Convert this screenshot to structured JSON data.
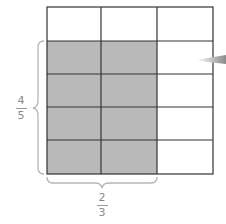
{
  "diagram": {
    "grid": {
      "rows": 5,
      "cols": 3,
      "shaded_rows": [
        1,
        2,
        3,
        4
      ],
      "shaded_cols": [
        0,
        1
      ]
    },
    "colors": {
      "shade": "#b9b9b9",
      "line": "#333333",
      "brace": "#b5b5b5",
      "text": "#8a8a8a",
      "arrow": "#9a9a9a"
    },
    "vertical_fraction": {
      "numerator": "4",
      "denominator": "5"
    },
    "horizontal_fraction": {
      "numerator": "2",
      "denominator": "3"
    }
  }
}
